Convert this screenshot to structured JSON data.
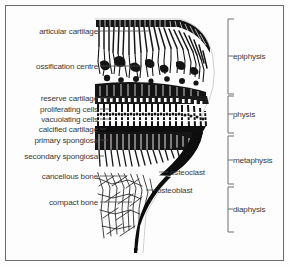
{
  "figure": {
    "kind": "anatomical-line-drawing",
    "background_color": "#fdfdfd",
    "ink_color": "#111111",
    "text_color": "#3a3a3a",
    "border_color": "#6a6a6a"
  },
  "left_labels": [
    {
      "id": "articular-cartilage",
      "text": "articular cartilage",
      "y": 31,
      "text_right_x": 98,
      "leader_to_x": 150
    },
    {
      "id": "ossification-centre",
      "text": "ossification centre",
      "y": 66,
      "text_right_x": 98,
      "leader_to_x": 142
    },
    {
      "id": "reserve-cartilage",
      "text": "reserve cartilage",
      "y": 98,
      "text_right_x": 98,
      "leader_to_x": 112
    },
    {
      "id": "proliferating-cells",
      "text": "proliferating cells",
      "y": 109,
      "text_right_x": 98,
      "leader_to_x": 110
    },
    {
      "id": "vacuolating-cells",
      "text": "vacuolating cells",
      "y": 119,
      "text_right_x": 98,
      "leader_to_x": 110
    },
    {
      "id": "calcified-cartilage",
      "text": "calcified cartilage",
      "y": 129,
      "text_right_x": 98,
      "leader_to_x": 106
    },
    {
      "id": "primary-spongiosa",
      "text": "primary spongiosa",
      "y": 140,
      "text_right_x": 98,
      "leader_to_x": 108
    },
    {
      "id": "secondary-spongiosa",
      "text": "secondary spongiosa",
      "y": 156,
      "text_right_x": 98,
      "leader_to_x": 104
    },
    {
      "id": "cancellous-bone",
      "text": "cancellous bone",
      "y": 176,
      "text_right_x": 98,
      "leader_to_x": 127
    },
    {
      "id": "compact-bone",
      "text": "compact bone",
      "y": 202,
      "text_right_x": 98,
      "leader_to_x": 132
    }
  ],
  "right_labels": [
    {
      "id": "osteoclast",
      "text": "osteoclast",
      "y": 172,
      "text_left_x": 170,
      "leader_from_x": 159
    },
    {
      "id": "osteoblast",
      "text": "osteoblast",
      "y": 190,
      "text_left_x": 157,
      "leader_from_x": 146
    }
  ],
  "brackets": [
    {
      "id": "epiphysis",
      "label": "epiphysis",
      "top": 19,
      "bottom": 94,
      "x": 228
    },
    {
      "id": "physis",
      "label": "physis",
      "top": 96,
      "bottom": 133,
      "x": 228
    },
    {
      "id": "metaphysis",
      "label": "metaphysis",
      "top": 136,
      "bottom": 184,
      "x": 228
    },
    {
      "id": "diaphysis",
      "label": "diaphysis",
      "top": 187,
      "bottom": 232,
      "x": 228
    }
  ]
}
